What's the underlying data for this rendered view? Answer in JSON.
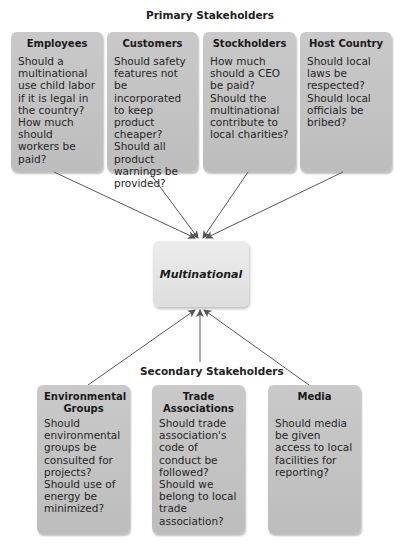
{
  "diagram": {
    "primary_title": "Primary Stakeholders",
    "secondary_title": "Secondary Stakeholders",
    "center": {
      "label": "Multinational"
    },
    "primary": [
      {
        "title": "Employees",
        "text": "Should a multinational use child labor if it is legal in the country? How much should workers be paid?"
      },
      {
        "title": "Customers",
        "text": "Should safety features not be incorporated to keep product cheaper? Should all product warnings be provided?"
      },
      {
        "title": "Stockholders",
        "text": "How much should a CEO be paid? Should the multinational contribute to local charities?"
      },
      {
        "title": "Host Country",
        "text": "Should local laws be respected? Should local officials be bribed?"
      }
    ],
    "secondary": [
      {
        "title": "Environmental Groups",
        "text": "Should environmental groups be consulted for projects? Should use of energy be minimized?"
      },
      {
        "title": "Trade Associations",
        "text": "Should trade association's code of conduct be followed? Should we belong to local trade association?"
      },
      {
        "title": "Media",
        "text": "Should media be given access to local facilities for reporting?"
      }
    ],
    "colors": {
      "box_fill": "#c4c4c4",
      "center_fill": "#e6e6e6",
      "arrow": "#555555"
    }
  }
}
